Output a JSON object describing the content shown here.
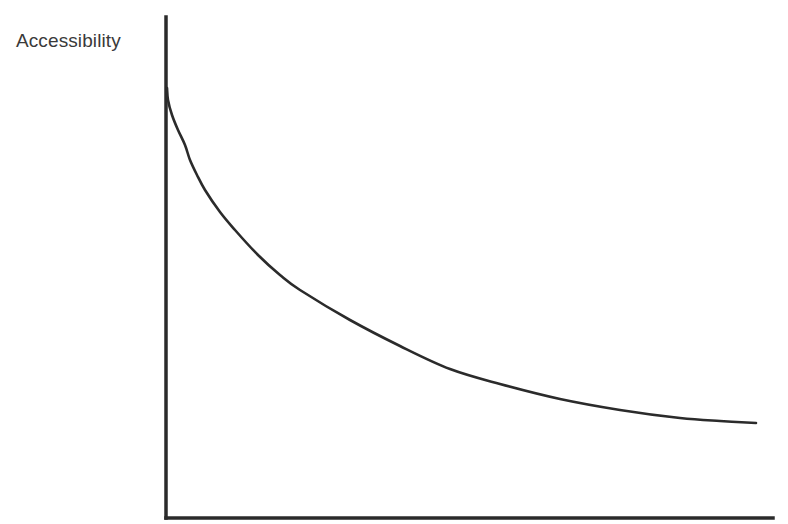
{
  "chart_data": {
    "type": "line",
    "title": "",
    "xlabel": "",
    "ylabel": "Accessibility",
    "grid": false,
    "legend": null,
    "x_ticks": [],
    "y_ticks": [],
    "series": [
      {
        "name": "accessibility-curve",
        "color": "#2b2b2b",
        "points_px": [
          [
            167,
            88
          ],
          [
            168,
            100
          ],
          [
            172,
            115
          ],
          [
            178,
            130
          ],
          [
            185,
            145
          ],
          [
            190,
            160
          ],
          [
            197,
            175
          ],
          [
            205,
            190
          ],
          [
            220,
            212
          ],
          [
            235,
            230
          ],
          [
            258,
            255
          ],
          [
            280,
            275
          ],
          [
            300,
            290
          ],
          [
            350,
            320
          ],
          [
            400,
            346
          ],
          [
            450,
            369
          ],
          [
            500,
            384
          ],
          [
            560,
            399
          ],
          [
            620,
            410
          ],
          [
            680,
            418
          ],
          [
            720,
            421
          ],
          [
            756,
            423
          ]
        ]
      }
    ],
    "axes": {
      "color": "#2b2b2b",
      "origin_px": [
        166,
        518
      ],
      "y_axis_top_px": 17,
      "x_axis_right_px": 773
    }
  }
}
